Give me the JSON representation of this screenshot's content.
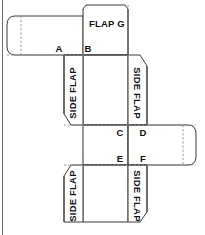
{
  "figure": {
    "background_color": "#ffffff",
    "cut_line_color": "#3a3a3a",
    "fold_line_color": "#8c8c8c",
    "label_color": "#111111"
  },
  "labels": {
    "flap_g": "FLAP G",
    "side_flap_left_upper": "SIDE FLAP",
    "side_flap_right_upper": "SIDE FLAP",
    "side_flap_left_lower": "SIDE FLAP",
    "side_flap_right_lower": "SIDE FLAP"
  },
  "points": {
    "a": "A",
    "b": "B",
    "c": "C",
    "d": "D",
    "e": "E",
    "f": "F"
  },
  "panels": [
    {
      "name": "flap-g",
      "label": "FLAP G",
      "kind": "top-closure-flap"
    },
    {
      "name": "left-glue-flap",
      "label": "",
      "kind": "glue-flap"
    },
    {
      "name": "upper-body-panel",
      "label": "",
      "kind": "body-panel"
    },
    {
      "name": "side-flap-left-upper",
      "label": "SIDE FLAP",
      "kind": "side-flap"
    },
    {
      "name": "side-flap-right-upper",
      "label": "SIDE FLAP",
      "kind": "side-flap"
    },
    {
      "name": "middle-body-panel",
      "label": "",
      "kind": "body-panel"
    },
    {
      "name": "right-glue-flap",
      "label": "",
      "kind": "glue-flap"
    },
    {
      "name": "lower-body-panel",
      "label": "",
      "kind": "body-panel"
    },
    {
      "name": "side-flap-left-lower",
      "label": "SIDE FLAP",
      "kind": "side-flap"
    },
    {
      "name": "side-flap-right-lower",
      "label": "SIDE FLAP",
      "kind": "side-flap"
    }
  ]
}
